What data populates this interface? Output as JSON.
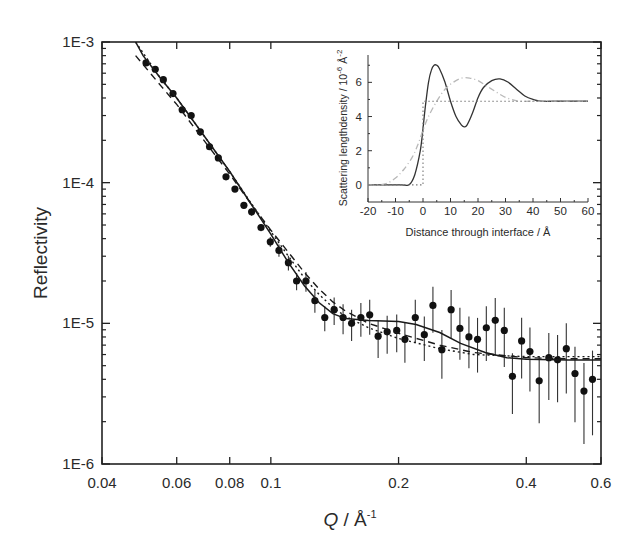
{
  "chart_data": [
    {
      "type": "scatter",
      "title": "",
      "xlabel": "Q / Å",
      "xlabel_superscript": "-1",
      "ylabel": "Reflectivity",
      "xscale": "log",
      "yscale": "log",
      "xlim": [
        0.04,
        0.6
      ],
      "ylim": [
        1e-06,
        0.001
      ],
      "xticks": [
        0.04,
        0.06,
        0.08,
        0.1,
        0.2,
        0.4,
        0.6
      ],
      "xtick_labels": [
        "0.04",
        "0.06",
        "0.08",
        "0.1",
        "0.2",
        "0.4",
        "0.6"
      ],
      "yticks": [
        1e-06,
        1e-05,
        0.0001,
        0.001
      ],
      "ytick_labels": [
        "1E-6",
        "1E-5",
        "1E-4",
        "1E-3"
      ],
      "grid": false,
      "legend": null,
      "series": [
        {
          "name": "Measured data",
          "style": "points-with-errorbars",
          "x": [
            0.0508,
            0.0534,
            0.0558,
            0.0588,
            0.0618,
            0.0649,
            0.0682,
            0.0717,
            0.0752,
            0.0784,
            0.0823,
            0.0864,
            0.0901,
            0.0948,
            0.0997,
            0.1045,
            0.11,
            0.115,
            0.121,
            0.127,
            0.134,
            0.141,
            0.148,
            0.155,
            0.163,
            0.171,
            0.179,
            0.188,
            0.198,
            0.207,
            0.219,
            0.23,
            0.241,
            0.253,
            0.266,
            0.279,
            0.293,
            0.307,
            0.322,
            0.338,
            0.355,
            0.371,
            0.39,
            0.408,
            0.429,
            0.452,
            0.474,
            0.497,
            0.521,
            0.547,
            0.573
          ],
          "y": [
            0.00071,
            0.00064,
            0.00054,
            0.00043,
            0.00033,
            0.0003,
            0.00023,
            0.00018,
            0.00015,
            0.00011,
            9e-05,
            6.9e-05,
            6.2e-05,
            4.8e-05,
            3.8e-05,
            3.3e-05,
            2.7e-05,
            2e-05,
            2e-05,
            1.45e-05,
            1.1e-05,
            1.25e-05,
            1.1e-05,
            1e-05,
            1.1e-05,
            1.15e-05,
            8.1e-06,
            8.7e-06,
            8.9e-06,
            7.7e-06,
            1.1e-05,
            8.3e-06,
            1.34e-05,
            6.5e-06,
            1.25e-05,
            9.2e-06,
            8e-06,
            7.7e-06,
            9.3e-06,
            1.05e-05,
            8.9e-06,
            4.2e-06,
            7.5e-06,
            6.3e-06,
            3.9e-06,
            5.7e-06,
            5.5e-06,
            6.6e-06,
            4.4e-06,
            3.3e-06,
            4e-06
          ],
          "err_rel": [
            0.02,
            0.02,
            0.02,
            0.02,
            0.02,
            0.02,
            0.03,
            0.03,
            0.03,
            0.03,
            0.04,
            0.05,
            0.06,
            0.06,
            0.08,
            0.1,
            0.12,
            0.14,
            0.16,
            0.18,
            0.2,
            0.22,
            0.24,
            0.25,
            0.27,
            0.28,
            0.3,
            0.3,
            0.3,
            0.32,
            0.34,
            0.35,
            0.36,
            0.38,
            0.38,
            0.4,
            0.4,
            0.42,
            0.42,
            0.44,
            0.45,
            0.46,
            0.46,
            0.48,
            0.5,
            0.5,
            0.5,
            0.52,
            0.55,
            0.58,
            0.6
          ]
        },
        {
          "name": "Fit (solid, oscillating profile)",
          "style": "solid",
          "x": [
            0.048,
            0.05,
            0.055,
            0.06,
            0.07,
            0.08,
            0.09,
            0.1,
            0.11,
            0.12,
            0.13,
            0.14,
            0.15,
            0.17,
            0.2,
            0.22,
            0.25,
            0.28,
            0.32,
            0.36,
            0.4,
            0.5,
            0.6
          ],
          "y": [
            0.001,
            0.0008,
            0.00055,
            0.0004,
            0.00021,
            0.00012,
            7e-05,
            4.3e-05,
            2.7e-05,
            1.85e-05,
            1.4e-05,
            1.17e-05,
            1.08e-05,
            1.05e-05,
            1.03e-05,
            9.8e-06,
            8.6e-06,
            7.2e-06,
            6.2e-06,
            5.7e-06,
            5.55e-06,
            5.5e-06,
            5.5e-06
          ]
        },
        {
          "name": "Fit (dashed)",
          "style": "dashed",
          "x": [
            0.048,
            0.055,
            0.06,
            0.07,
            0.08,
            0.09,
            0.1,
            0.11,
            0.12,
            0.13,
            0.14,
            0.15,
            0.17,
            0.2,
            0.25,
            0.3,
            0.4,
            0.5,
            0.6
          ],
          "y": [
            0.0008,
            0.00049,
            0.00036,
            0.000195,
            0.000115,
            7e-05,
            4.6e-05,
            3.2e-05,
            2.3e-05,
            1.75e-05,
            1.42e-05,
            1.22e-05,
            1e-05,
            8.5e-06,
            7e-06,
            6.2e-06,
            5.7e-06,
            5.6e-06,
            5.6e-06
          ]
        },
        {
          "name": "Fit (dotted, uniform layer)",
          "style": "dotted",
          "x": [
            0.048,
            0.055,
            0.06,
            0.07,
            0.08,
            0.09,
            0.1,
            0.11,
            0.12,
            0.13,
            0.14,
            0.15,
            0.17,
            0.2,
            0.25,
            0.3,
            0.4,
            0.5,
            0.6
          ],
          "y": [
            0.001,
            0.00055,
            0.0004,
            0.00021,
            0.00012,
            7.1e-05,
            4.5e-05,
            3e-05,
            2.1e-05,
            1.6e-05,
            1.3e-05,
            1.12e-05,
            9.3e-06,
            7.8e-06,
            6.6e-06,
            6e-06,
            5.8e-06,
            5.8e-06,
            5.8e-06
          ]
        }
      ]
    },
    {
      "type": "line",
      "title": "",
      "inset": true,
      "xlabel": "Distance through interface / Å",
      "ylabel": "Scattering lengthdensity / 10",
      "ylabel_superscript": "-6",
      "ylabel_suffix": " Å",
      "ylabel_suffix_superscript": "-2",
      "xlim": [
        -20,
        60
      ],
      "ylim": [
        -1,
        7.6
      ],
      "xticks": [
        -20,
        -10,
        0,
        10,
        20,
        30,
        40,
        50,
        60
      ],
      "xtick_labels": [
        "-20",
        "-10",
        "0",
        "10",
        "20",
        "30",
        "40",
        "50",
        "60"
      ],
      "yticks": [
        0,
        2,
        4,
        6
      ],
      "ytick_labels": [
        "0",
        "2",
        "4",
        "6"
      ],
      "grid": false,
      "series": [
        {
          "name": "Oscillating profile",
          "style": "solid",
          "x": [
            -20,
            -8,
            -5,
            -3,
            -1,
            0,
            1,
            2,
            3,
            4,
            5,
            6,
            8,
            10,
            12,
            14,
            15,
            16,
            18,
            20,
            22,
            25,
            28,
            31,
            34,
            37,
            40,
            43,
            50,
            60
          ],
          "y": [
            0,
            0,
            0.02,
            0.6,
            2.0,
            3.3,
            4.8,
            6.0,
            6.7,
            7.0,
            7.0,
            6.8,
            6.0,
            4.9,
            4.0,
            3.5,
            3.4,
            3.5,
            4.2,
            5.1,
            5.7,
            6.1,
            6.2,
            6.0,
            5.6,
            5.2,
            5.0,
            4.9,
            4.9,
            4.9
          ]
        },
        {
          "name": "Broad profile",
          "style": "dash-dot-gray",
          "x": [
            -20,
            -16,
            -13,
            -10,
            -7,
            -4,
            -2,
            0,
            2,
            5,
            8,
            11,
            14,
            17,
            20,
            23,
            26,
            29,
            32,
            35,
            40,
            50,
            60
          ],
          "y": [
            0,
            0,
            0.1,
            0.4,
            0.9,
            1.6,
            2.3,
            3.2,
            4.0,
            4.9,
            5.6,
            6.0,
            6.25,
            6.25,
            6.1,
            5.8,
            5.5,
            5.2,
            5.0,
            4.9,
            4.9,
            4.9,
            4.9
          ]
        },
        {
          "name": "Step profile",
          "style": "dotted",
          "x": [
            -20,
            0,
            0,
            60
          ],
          "y": [
            0,
            0,
            4.9,
            4.9
          ]
        }
      ]
    }
  ]
}
